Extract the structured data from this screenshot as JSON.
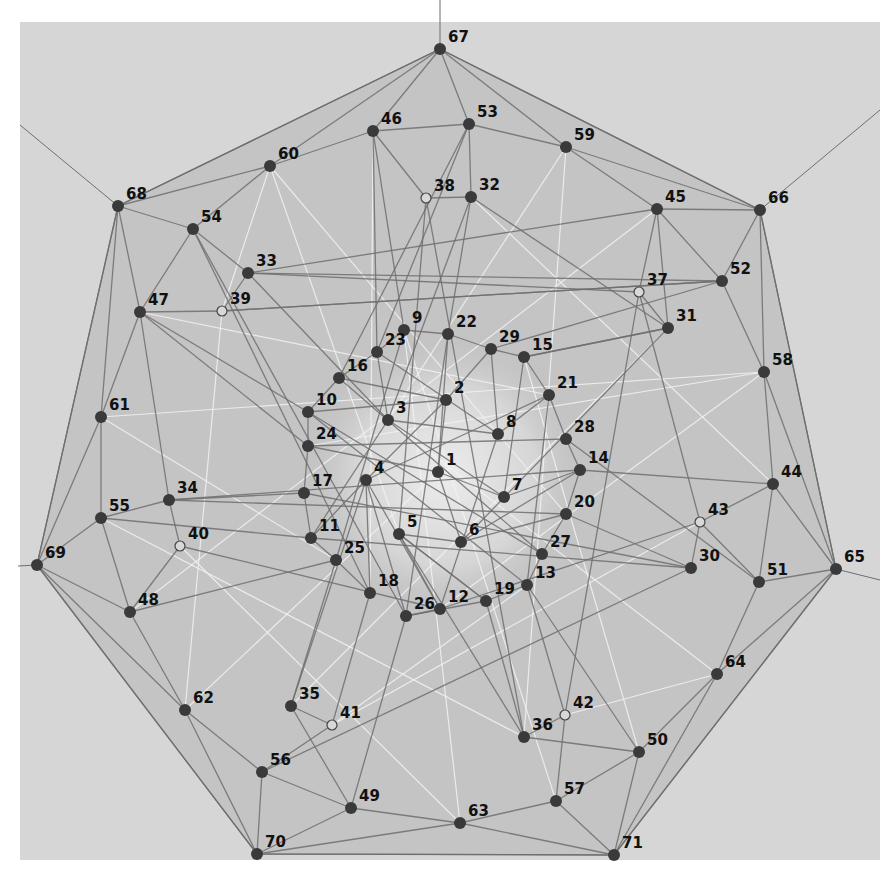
{
  "diagram": {
    "title": "",
    "type": "graph",
    "canvas": {
      "width": 894,
      "height": 876
    },
    "panel": {
      "x": 20,
      "y": 22,
      "width": 860,
      "height": 838,
      "color": "#d6d6d6"
    },
    "colors": {
      "page_background": "#ffffff",
      "outer_region": "#c4c4c4",
      "inner_region": "#bdbdbd",
      "center_glow": "#e2e2e2",
      "edge_dark": "#6e6e6e",
      "edge_mid": "#8c8c8c",
      "edge_light": "#f2f2f2",
      "node_fill": "#3a3a3a",
      "open_node_fill": "#d8d8d8",
      "open_node_stroke": "#444444",
      "label_color": "#111111"
    },
    "hull": [
      67,
      66,
      65,
      71,
      70,
      69,
      68
    ],
    "rays": [
      {
        "from": 67,
        "to": [
          440,
          0
        ]
      },
      {
        "from": 66,
        "to": [
          880,
          110
        ]
      },
      {
        "from": 65,
        "to": [
          880,
          580
        ]
      },
      {
        "from": 69,
        "to": [
          18,
          566
        ]
      },
      {
        "from": 68,
        "to": [
          20,
          125
        ]
      }
    ],
    "nodes": [
      {
        "id": "1",
        "x": 438,
        "y": 472,
        "open": false
      },
      {
        "id": "2",
        "x": 446,
        "y": 400,
        "open": false
      },
      {
        "id": "3",
        "x": 388,
        "y": 420,
        "open": false
      },
      {
        "id": "4",
        "x": 366,
        "y": 480,
        "open": false
      },
      {
        "id": "5",
        "x": 399,
        "y": 534,
        "open": false
      },
      {
        "id": "6",
        "x": 461,
        "y": 542,
        "open": false
      },
      {
        "id": "7",
        "x": 504,
        "y": 497,
        "open": false
      },
      {
        "id": "8",
        "x": 498,
        "y": 434,
        "open": false
      },
      {
        "id": "9",
        "x": 404,
        "y": 330,
        "open": false
      },
      {
        "id": "10",
        "x": 308,
        "y": 412,
        "open": false
      },
      {
        "id": "11",
        "x": 311,
        "y": 538,
        "open": false
      },
      {
        "id": "12",
        "x": 440,
        "y": 609,
        "open": false
      },
      {
        "id": "13",
        "x": 527,
        "y": 585,
        "open": false
      },
      {
        "id": "14",
        "x": 580,
        "y": 470,
        "open": false
      },
      {
        "id": "15",
        "x": 524,
        "y": 357,
        "open": false
      },
      {
        "id": "16",
        "x": 339,
        "y": 378,
        "open": false
      },
      {
        "id": "17",
        "x": 304,
        "y": 493,
        "open": false
      },
      {
        "id": "18",
        "x": 370,
        "y": 593,
        "open": false
      },
      {
        "id": "19",
        "x": 486,
        "y": 601,
        "open": false
      },
      {
        "id": "20",
        "x": 566,
        "y": 514,
        "open": false
      },
      {
        "id": "21",
        "x": 549,
        "y": 395,
        "open": false
      },
      {
        "id": "22",
        "x": 448,
        "y": 334,
        "open": false
      },
      {
        "id": "23",
        "x": 377,
        "y": 352,
        "open": false
      },
      {
        "id": "24",
        "x": 308,
        "y": 446,
        "open": false
      },
      {
        "id": "25",
        "x": 336,
        "y": 560,
        "open": false
      },
      {
        "id": "26",
        "x": 406,
        "y": 616,
        "open": false
      },
      {
        "id": "27",
        "x": 542,
        "y": 554,
        "open": false
      },
      {
        "id": "28",
        "x": 566,
        "y": 439,
        "open": false
      },
      {
        "id": "29",
        "x": 491,
        "y": 349,
        "open": false
      },
      {
        "id": "30",
        "x": 691,
        "y": 568,
        "open": false
      },
      {
        "id": "31",
        "x": 668,
        "y": 328,
        "open": false
      },
      {
        "id": "32",
        "x": 471,
        "y": 197,
        "open": false
      },
      {
        "id": "33",
        "x": 248,
        "y": 273,
        "open": false
      },
      {
        "id": "34",
        "x": 169,
        "y": 500,
        "open": false
      },
      {
        "id": "35",
        "x": 291,
        "y": 706,
        "open": false
      },
      {
        "id": "36",
        "x": 524,
        "y": 737,
        "open": false
      },
      {
        "id": "37",
        "x": 639,
        "y": 292,
        "open": true
      },
      {
        "id": "38",
        "x": 426,
        "y": 198,
        "open": true
      },
      {
        "id": "39",
        "x": 222,
        "y": 311,
        "open": true
      },
      {
        "id": "40",
        "x": 180,
        "y": 546,
        "open": true
      },
      {
        "id": "41",
        "x": 332,
        "y": 725,
        "open": true
      },
      {
        "id": "42",
        "x": 565,
        "y": 715,
        "open": true
      },
      {
        "id": "43",
        "x": 700,
        "y": 522,
        "open": true
      },
      {
        "id": "44",
        "x": 773,
        "y": 484,
        "open": false
      },
      {
        "id": "45",
        "x": 657,
        "y": 209,
        "open": false
      },
      {
        "id": "46",
        "x": 373,
        "y": 131,
        "open": false
      },
      {
        "id": "47",
        "x": 140,
        "y": 312,
        "open": false
      },
      {
        "id": "48",
        "x": 130,
        "y": 612,
        "open": false
      },
      {
        "id": "49",
        "x": 351,
        "y": 808,
        "open": false
      },
      {
        "id": "50",
        "x": 639,
        "y": 752,
        "open": false
      },
      {
        "id": "51",
        "x": 759,
        "y": 582,
        "open": false
      },
      {
        "id": "52",
        "x": 722,
        "y": 281,
        "open": false
      },
      {
        "id": "53",
        "x": 469,
        "y": 124,
        "open": false
      },
      {
        "id": "54",
        "x": 193,
        "y": 229,
        "open": false
      },
      {
        "id": "55",
        "x": 101,
        "y": 518,
        "open": false
      },
      {
        "id": "56",
        "x": 262,
        "y": 772,
        "open": false
      },
      {
        "id": "57",
        "x": 556,
        "y": 801,
        "open": false
      },
      {
        "id": "58",
        "x": 764,
        "y": 372,
        "open": false
      },
      {
        "id": "59",
        "x": 566,
        "y": 147,
        "open": false
      },
      {
        "id": "60",
        "x": 270,
        "y": 166,
        "open": false
      },
      {
        "id": "61",
        "x": 101,
        "y": 417,
        "open": false
      },
      {
        "id": "62",
        "x": 185,
        "y": 710,
        "open": false
      },
      {
        "id": "63",
        "x": 460,
        "y": 823,
        "open": false
      },
      {
        "id": "64",
        "x": 717,
        "y": 674,
        "open": false
      },
      {
        "id": "65",
        "x": 836,
        "y": 569,
        "open": false
      },
      {
        "id": "66",
        "x": 760,
        "y": 210,
        "open": false
      },
      {
        "id": "67",
        "x": 440,
        "y": 49,
        "open": false
      },
      {
        "id": "68",
        "x": 118,
        "y": 206,
        "open": false
      },
      {
        "id": "69",
        "x": 37,
        "y": 565,
        "open": false
      },
      {
        "id": "70",
        "x": 257,
        "y": 854,
        "open": false
      },
      {
        "id": "71",
        "x": 614,
        "y": 855,
        "open": false
      }
    ],
    "edges_dark": [
      [
        67,
        46
      ],
      [
        67,
        53
      ],
      [
        67,
        59
      ],
      [
        67,
        60
      ],
      [
        67,
        68
      ],
      [
        67,
        66
      ],
      [
        46,
        60
      ],
      [
        46,
        53
      ],
      [
        46,
        38
      ],
      [
        46,
        9
      ],
      [
        46,
        23
      ],
      [
        60,
        68
      ],
      [
        60,
        54
      ],
      [
        68,
        54
      ],
      [
        68,
        47
      ],
      [
        68,
        61
      ],
      [
        68,
        69
      ],
      [
        54,
        47
      ],
      [
        54,
        33
      ],
      [
        54,
        18
      ],
      [
        54,
        26
      ],
      [
        53,
        59
      ],
      [
        53,
        32
      ],
      [
        53,
        23
      ],
      [
        53,
        16
      ],
      [
        59,
        45
      ],
      [
        59,
        66
      ],
      [
        45,
        66
      ],
      [
        45,
        52
      ],
      [
        45,
        37
      ],
      [
        45,
        33
      ],
      [
        45,
        31
      ],
      [
        66,
        52
      ],
      [
        66,
        58
      ],
      [
        66,
        65
      ],
      [
        52,
        58
      ],
      [
        52,
        39
      ],
      [
        52,
        33
      ],
      [
        52,
        29
      ],
      [
        58,
        44
      ],
      [
        58,
        65
      ],
      [
        44,
        65
      ],
      [
        44,
        51
      ],
      [
        44,
        14
      ],
      [
        44,
        43
      ],
      [
        65,
        51
      ],
      [
        65,
        64
      ],
      [
        65,
        71
      ],
      [
        51,
        64
      ],
      [
        51,
        43
      ],
      [
        51,
        28
      ],
      [
        64,
        50
      ],
      [
        64,
        71
      ],
      [
        50,
        71
      ],
      [
        50,
        57
      ],
      [
        50,
        36
      ],
      [
        50,
        13
      ],
      [
        71,
        57
      ],
      [
        71,
        63
      ],
      [
        71,
        70
      ],
      [
        57,
        63
      ],
      [
        57,
        42
      ],
      [
        63,
        49
      ],
      [
        63,
        70
      ],
      [
        49,
        70
      ],
      [
        49,
        56
      ],
      [
        49,
        35
      ],
      [
        49,
        26
      ],
      [
        70,
        56
      ],
      [
        70,
        62
      ],
      [
        70,
        69
      ],
      [
        56,
        62
      ],
      [
        56,
        41
      ],
      [
        56,
        30
      ],
      [
        62,
        48
      ],
      [
        62,
        69
      ],
      [
        48,
        69
      ],
      [
        48,
        55
      ],
      [
        48,
        40
      ],
      [
        48,
        25
      ],
      [
        69,
        55
      ],
      [
        69,
        61
      ],
      [
        55,
        61
      ],
      [
        55,
        34
      ],
      [
        55,
        11
      ],
      [
        61,
        47
      ],
      [
        47,
        34
      ],
      [
        47,
        24
      ],
      [
        47,
        10
      ],
      [
        33,
        39
      ],
      [
        33,
        3
      ],
      [
        33,
        37
      ],
      [
        39,
        52
      ],
      [
        39,
        47
      ],
      [
        34,
        40
      ],
      [
        34,
        17
      ],
      [
        34,
        14
      ],
      [
        38,
        32
      ],
      [
        38,
        36
      ],
      [
        38,
        5
      ],
      [
        32,
        22
      ],
      [
        32,
        31
      ],
      [
        32,
        3
      ],
      [
        31,
        37
      ],
      [
        31,
        15
      ],
      [
        31,
        6
      ],
      [
        37,
        43
      ],
      [
        37,
        42
      ],
      [
        43,
        30
      ],
      [
        43,
        12
      ],
      [
        42,
        36
      ],
      [
        42,
        13
      ],
      [
        41,
        35
      ],
      [
        41,
        18
      ],
      [
        40,
        12
      ],
      [
        35,
        4
      ],
      [
        35,
        25
      ],
      [
        36,
        19
      ],
      [
        36,
        5
      ],
      [
        30,
        20
      ],
      [
        30,
        11
      ],
      [
        1,
        2
      ],
      [
        1,
        6
      ],
      [
        1,
        24
      ],
      [
        1,
        7
      ],
      [
        2,
        16
      ],
      [
        2,
        10
      ],
      [
        2,
        4
      ],
      [
        3,
        7
      ],
      [
        3,
        11
      ],
      [
        3,
        8
      ],
      [
        4,
        18
      ],
      [
        4,
        12
      ],
      [
        4,
        11
      ],
      [
        4,
        26
      ],
      [
        5,
        12
      ],
      [
        5,
        19
      ],
      [
        5,
        6
      ],
      [
        6,
        20
      ],
      [
        6,
        14
      ],
      [
        7,
        15
      ],
      [
        7,
        14
      ],
      [
        8,
        29
      ],
      [
        8,
        21
      ],
      [
        8,
        23
      ],
      [
        9,
        22
      ],
      [
        9,
        23
      ],
      [
        9,
        25
      ],
      [
        10,
        16
      ],
      [
        10,
        24
      ],
      [
        10,
        13
      ],
      [
        11,
        17
      ],
      [
        11,
        25
      ],
      [
        12,
        26
      ],
      [
        12,
        8
      ],
      [
        13,
        27
      ],
      [
        13,
        19
      ],
      [
        13,
        21
      ],
      [
        14,
        20
      ],
      [
        14,
        28
      ],
      [
        15,
        29
      ],
      [
        15,
        21
      ],
      [
        15,
        31
      ],
      [
        16,
        23
      ],
      [
        16,
        27
      ],
      [
        17,
        24
      ],
      [
        17,
        30
      ],
      [
        18,
        25
      ],
      [
        19,
        26
      ],
      [
        19,
        5
      ],
      [
        20,
        27
      ],
      [
        20,
        34
      ],
      [
        21,
        28
      ],
      [
        21,
        4
      ],
      [
        22,
        29
      ],
      [
        22,
        1
      ],
      [
        23,
        3
      ],
      [
        24,
        28
      ],
      [
        26,
        22
      ],
      [
        27,
        10
      ],
      [
        29,
        2
      ]
    ],
    "edges_light": [
      [
        60,
        39
      ],
      [
        60,
        5
      ],
      [
        60,
        20
      ],
      [
        59,
        3
      ],
      [
        59,
        36
      ],
      [
        61,
        58
      ],
      [
        61,
        25
      ],
      [
        62,
        39
      ],
      [
        62,
        1
      ],
      [
        63,
        40
      ],
      [
        63,
        9
      ],
      [
        64,
        42
      ],
      [
        64,
        3
      ],
      [
        58,
        24
      ],
      [
        58,
        12
      ],
      [
        55,
        36
      ],
      [
        48,
        45
      ],
      [
        47,
        21
      ],
      [
        44,
        32
      ],
      [
        41,
        43
      ],
      [
        41,
        13
      ],
      [
        35,
        31
      ],
      [
        50,
        15
      ],
      [
        57,
        9
      ],
      [
        46,
        18
      ]
    ]
  }
}
